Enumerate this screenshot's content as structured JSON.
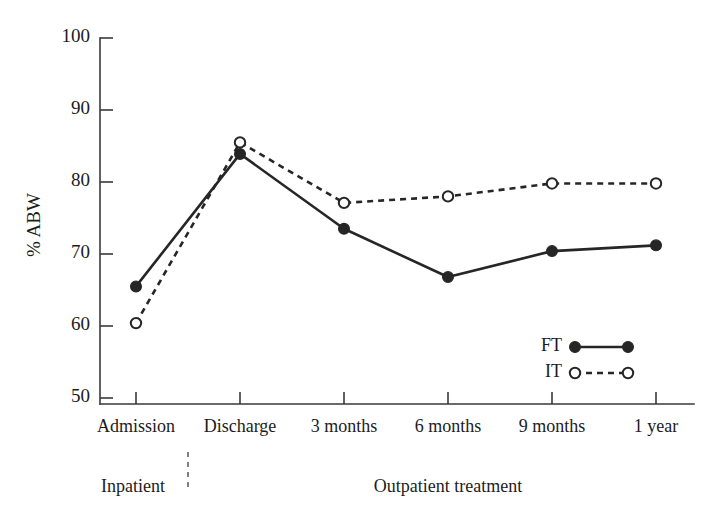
{
  "chart_data": {
    "type": "line",
    "title": "",
    "xlabel": "",
    "ylabel": "% ABW",
    "categories": [
      "Admission",
      "Discharge",
      "3 months",
      "6 months",
      "9 months",
      "1 year"
    ],
    "series": [
      {
        "name": "FT",
        "marker": "filled-circle",
        "linestyle": "solid",
        "color": "#262626",
        "values": [
          65.5,
          83.9,
          73.5,
          66.8,
          70.4,
          71.2
        ]
      },
      {
        "name": "IT",
        "marker": "open-circle",
        "linestyle": "dashed",
        "color": "#262626",
        "values": [
          60.4,
          85.5,
          77.1,
          78.0,
          79.8,
          79.8
        ]
      }
    ],
    "ylim": [
      50,
      100
    ],
    "yticks": [
      50,
      60,
      70,
      80,
      90,
      100
    ],
    "ytick_labels": [
      "50",
      "60",
      "70",
      "80",
      "90",
      "100"
    ],
    "grid": false,
    "legend_position": "bottom-right",
    "annotations": {
      "phase_inpatient": "Inpatient",
      "phase_outpatient": "Outpatient treatment",
      "divider_after_category": "Discharge"
    }
  },
  "legend": {
    "entries": [
      {
        "label": "FT"
      },
      {
        "label": "IT"
      }
    ]
  }
}
